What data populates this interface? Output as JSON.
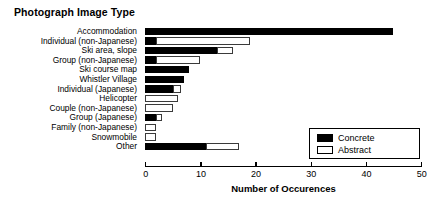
{
  "chart_data": {
    "type": "bar",
    "orientation": "horizontal",
    "stacked": true,
    "title": "Photograph Image Type",
    "xlabel": "Number of Occurences",
    "ylabel": "",
    "xlim": [
      0,
      50
    ],
    "xticks": [
      0,
      10,
      20,
      30,
      40,
      50
    ],
    "xtick_labels": [
      "0",
      "10",
      "20",
      "30",
      "40",
      "50"
    ],
    "grid": false,
    "legend_position": "lower-right",
    "categories": [
      "Accommodation",
      "Individual (non-Japanese)",
      "Ski area, slope",
      "Group (non-Japanese)",
      "Ski course map",
      "Whistler Village",
      "Individual (Japanese)",
      "Helicopter",
      "Couple (non-Japanese)",
      "Group (Japanese)",
      "Family (non-Japanese)",
      "Snowmobile",
      "Other"
    ],
    "series": [
      {
        "name": "Concrete",
        "color": "#000000",
        "values": [
          45,
          2,
          13,
          2,
          8,
          7,
          5,
          0,
          0,
          2,
          0,
          0,
          11
        ]
      },
      {
        "name": "Abstract",
        "color": "#ffffff",
        "values": [
          0,
          17,
          3,
          8,
          0,
          0,
          1.5,
          6,
          5,
          1,
          2,
          2,
          6
        ]
      }
    ],
    "totals": [
      45,
      19,
      16,
      10,
      8,
      7,
      6.5,
      6,
      5,
      3,
      2,
      2,
      17
    ]
  },
  "legend": {
    "entries": [
      {
        "label": "Concrete",
        "swatch": "filled-black-swatch"
      },
      {
        "label": "Abstract",
        "swatch": "outlined-white-swatch"
      }
    ]
  }
}
